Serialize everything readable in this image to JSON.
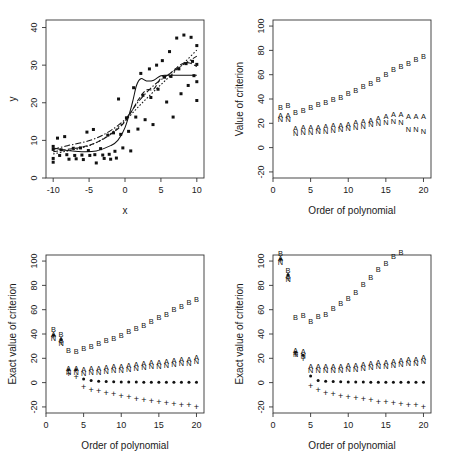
{
  "figure": {
    "panel_count": 4,
    "background": "#ffffff",
    "marker_color": "#111111"
  },
  "chart_data": [
    {
      "id": "panel-top-left",
      "type": "scatter",
      "title": "",
      "xlabel": "x",
      "ylabel": "y",
      "xlim": [
        -11,
        11
      ],
      "ylim": [
        0,
        42
      ],
      "xticks": [
        -10,
        -5,
        0,
        5,
        10
      ],
      "yticks": [
        0,
        10,
        20,
        30,
        40
      ],
      "xtick_labels": [
        "-10",
        "-5",
        "0",
        "5",
        "10"
      ],
      "ytick_labels": [
        "0",
        "10",
        "20",
        "30",
        "40"
      ],
      "grid": false,
      "legend": "none",
      "points": [
        [
          -10,
          8.4
        ],
        [
          -10,
          7.6
        ],
        [
          -10,
          5.2
        ],
        [
          -10,
          4.2
        ],
        [
          -9.4,
          10.6
        ],
        [
          -9.1,
          6.0
        ],
        [
          -8.9,
          7.5
        ],
        [
          -8.4,
          11.0
        ],
        [
          -8.1,
          6.2
        ],
        [
          -7.8,
          5.0
        ],
        [
          -7.2,
          7.9
        ],
        [
          -7.0,
          6.0
        ],
        [
          -6.8,
          5.1
        ],
        [
          -6.2,
          8.0
        ],
        [
          -6.0,
          6.1
        ],
        [
          -5.8,
          4.9
        ],
        [
          -5.3,
          12.2
        ],
        [
          -5.1,
          7.3
        ],
        [
          -4.9,
          6.0
        ],
        [
          -4.4,
          12.9
        ],
        [
          -4.2,
          6.2
        ],
        [
          -4.0,
          4.0
        ],
        [
          -3.4,
          7.8
        ],
        [
          -3.1,
          6.1
        ],
        [
          -2.9,
          5.2
        ],
        [
          -2.4,
          11.4
        ],
        [
          -2.2,
          6.3
        ],
        [
          -2.0,
          5.0
        ],
        [
          -1.6,
          12.0
        ],
        [
          -1.4,
          7.1
        ],
        [
          -1.2,
          5.3
        ],
        [
          -0.9,
          21.0
        ],
        [
          -0.6,
          11.6
        ],
        [
          -0.3,
          8.0
        ],
        [
          0.2,
          16.0
        ],
        [
          0.5,
          12.4
        ],
        [
          0.8,
          7.2
        ],
        [
          1.2,
          24.0
        ],
        [
          1.5,
          16.2
        ],
        [
          1.8,
          13.0
        ],
        [
          2.2,
          27.8
        ],
        [
          2.5,
          22.0
        ],
        [
          2.8,
          15.5
        ],
        [
          3.4,
          29.0
        ],
        [
          3.6,
          21.4
        ],
        [
          3.9,
          14.2
        ],
        [
          4.4,
          30.0
        ],
        [
          4.6,
          23.6
        ],
        [
          5.2,
          31.2
        ],
        [
          5.5,
          26.8
        ],
        [
          5.8,
          20.2
        ],
        [
          6.2,
          33.6
        ],
        [
          6.4,
          27.0
        ],
        [
          6.7,
          16.2
        ],
        [
          7.2,
          37.2
        ],
        [
          7.5,
          29.0
        ],
        [
          7.8,
          22.4
        ],
        [
          8.2,
          38.0
        ],
        [
          8.5,
          30.4
        ],
        [
          8.8,
          24.6
        ],
        [
          9.2,
          37.4
        ],
        [
          9.4,
          31.0
        ],
        [
          9.6,
          27.2
        ],
        [
          10,
          35.2
        ],
        [
          10,
          30.2
        ],
        [
          10,
          25.6
        ],
        [
          10,
          20.6
        ]
      ],
      "curves": [
        {
          "name": "fit-solid",
          "style": "solid",
          "x": [
            -10,
            -8,
            -6,
            -4,
            -2,
            -1,
            0,
            1,
            1.6,
            2.2,
            3,
            4,
            5,
            6,
            7,
            8,
            9,
            10
          ],
          "y": [
            8.0,
            7.3,
            7.0,
            7.2,
            8.6,
            10.0,
            13.4,
            19.8,
            24.6,
            26.4,
            25.8,
            26.0,
            27.2,
            27.3,
            27.3,
            27.3,
            27.3,
            27.3
          ]
        },
        {
          "name": "fit-dashed",
          "style": "dashed",
          "x": [
            -10,
            -8,
            -6,
            -4,
            -2,
            0,
            2,
            3,
            4,
            5,
            6,
            7,
            8,
            9,
            10
          ],
          "y": [
            7.0,
            7.6,
            8.2,
            9.4,
            11.6,
            15.0,
            21.2,
            23.4,
            23.6,
            26.6,
            27.4,
            29.0,
            30.4,
            30.6,
            29.6
          ]
        },
        {
          "name": "fit-dotted",
          "style": "dotted",
          "x": [
            -10,
            -8,
            -6,
            -4,
            -2,
            0,
            2,
            4,
            6,
            8,
            10
          ],
          "y": [
            6.4,
            7.2,
            8.0,
            9.4,
            11.8,
            15.2,
            19.2,
            23.0,
            26.6,
            30.2,
            34.0
          ]
        },
        {
          "name": "fit-dashdot",
          "style": "dashdot",
          "x": [
            -10,
            -8,
            -6,
            -4,
            -2,
            0,
            2,
            4,
            6,
            8,
            10
          ],
          "y": [
            7.6,
            8.6,
            9.4,
            10.6,
            12.6,
            15.6,
            20.6,
            24.6,
            27.4,
            30.0,
            32.4
          ]
        }
      ]
    },
    {
      "id": "panel-top-right",
      "type": "scatter",
      "title": "",
      "xlabel": "Order of polynomial",
      "ylabel": "Value of criterion",
      "xlim": [
        0,
        21
      ],
      "ylim": [
        -25,
        105
      ],
      "xticks": [
        0,
        5,
        10,
        15,
        20
      ],
      "yticks": [
        -20,
        0,
        20,
        40,
        60,
        80,
        100
      ],
      "xtick_labels": [
        "0",
        "5",
        "10",
        "15",
        "20"
      ],
      "ytick_labels": [
        "-20",
        "0",
        "20",
        "40",
        "60",
        "80",
        "100"
      ],
      "grid": false,
      "legend": "none",
      "x": [
        1,
        2,
        3,
        4,
        5,
        6,
        7,
        8,
        9,
        10,
        11,
        12,
        13,
        14,
        15,
        16,
        17,
        18,
        19,
        20
      ],
      "series": [
        {
          "name": "B",
          "marker": "B",
          "values": [
            30.5,
            31.5,
            26.0,
            28.0,
            30.5,
            32.5,
            34.5,
            37.0,
            38.5,
            41.5,
            44.5,
            47.5,
            50.0,
            53.5,
            57.5,
            61.5,
            63.5,
            66.5,
            69.5,
            72.0
          ]
        },
        {
          "name": "A",
          "marker": "A",
          "values": [
            26.5,
            26.5,
            15.5,
            16.5,
            16.5,
            17.0,
            17.5,
            18.0,
            18.5,
            19.5,
            20.5,
            21.5,
            22.5,
            24.0,
            25.5,
            27.0,
            27.5,
            26.0,
            25.5,
            25.5
          ]
        },
        {
          "name": "N",
          "marker": "N",
          "values": [
            26.0,
            26.0,
            14.5,
            15.0,
            15.5,
            16.0,
            16.5,
            17.0,
            17.5,
            18.5,
            19.5,
            20.5,
            21.5,
            22.5,
            23.5,
            24.5,
            23.5,
            17.5,
            17.5,
            16.5
          ]
        }
      ]
    },
    {
      "id": "panel-bottom-left",
      "type": "scatter",
      "title": "",
      "xlabel": "Order of polynomial",
      "ylabel": "Exact value of criterion",
      "xlim": [
        0,
        21
      ],
      "ylim": [
        -25,
        105
      ],
      "xticks": [
        0,
        5,
        10,
        15,
        20
      ],
      "yticks": [
        -20,
        0,
        20,
        40,
        60,
        80,
        100
      ],
      "xtick_labels": [
        "0",
        "5",
        "10",
        "15",
        "20"
      ],
      "ytick_labels": [
        "-20",
        "0",
        "20",
        "40",
        "60",
        "80",
        "100"
      ],
      "grid": false,
      "legend": "none",
      "x": [
        1,
        2,
        3,
        4,
        5,
        6,
        7,
        8,
        9,
        10,
        11,
        12,
        13,
        14,
        15,
        16,
        17,
        18,
        19,
        20
      ],
      "series": [
        {
          "name": "B",
          "marker": "B",
          "values": [
            41.0,
            36.5,
            23.5,
            23.0,
            25.0,
            27.0,
            29.5,
            31.5,
            33.5,
            36.0,
            39.0,
            41.5,
            44.5,
            47.5,
            50.5,
            53.5,
            57.0,
            60.0,
            63.0,
            65.5
          ]
        },
        {
          "name": "A",
          "marker": "A",
          "values": [
            39.5,
            35.5,
            11.5,
            11.5,
            11.0,
            11.5,
            12.0,
            12.5,
            13.0,
            13.5,
            14.5,
            15.0,
            15.5,
            16.5,
            17.0,
            17.5,
            18.5,
            19.0,
            19.5,
            20.5
          ]
        },
        {
          "name": "N",
          "marker": "N",
          "values": [
            39.0,
            35.0,
            11.0,
            11.0,
            10.5,
            11.0,
            11.5,
            12.0,
            12.5,
            13.0,
            14.0,
            14.5,
            15.0,
            16.0,
            16.5,
            17.0,
            18.0,
            18.5,
            19.0,
            20.0
          ]
        },
        {
          "name": "star",
          "marker": "*",
          "values": [
            39.0,
            35.5,
            10.5,
            10.5,
            3.0,
            1.8,
            1.2,
            0.9,
            0.7,
            0.6,
            0.5,
            0.5,
            0.4,
            0.4,
            0.4,
            0.3,
            0.3,
            0.3,
            0.3,
            0.3
          ]
        },
        {
          "name": "plus",
          "marker": "+",
          "values": [
            38.5,
            33.0,
            7.5,
            5.0,
            -3.5,
            -5.5,
            -7.0,
            -8.5,
            -9.5,
            -10.5,
            -12.0,
            -13.0,
            -14.0,
            -15.0,
            -16.0,
            -16.5,
            -17.5,
            -18.0,
            -18.5,
            -19.5
          ]
        }
      ]
    },
    {
      "id": "panel-bottom-right",
      "type": "scatter",
      "title": "",
      "xlabel": "Order of polynomial",
      "ylabel": "Exact value of criterion",
      "xlim": [
        0,
        21
      ],
      "ylim": [
        -25,
        105
      ],
      "xticks": [
        0,
        5,
        10,
        15,
        20
      ],
      "yticks": [
        -20,
        0,
        20,
        40,
        60,
        80,
        100
      ],
      "xtick_labels": [
        "0",
        "5",
        "10",
        "15",
        "20"
      ],
      "ytick_labels": [
        "-20",
        "0",
        "20",
        "40",
        "60",
        "80",
        "100"
      ],
      "grid": false,
      "legend": "none",
      "note": "B series exceeds the upper axis limit for orders 15 and above and is clipped",
      "x": [
        1,
        2,
        3,
        4,
        5,
        6,
        7,
        8,
        9,
        10,
        11,
        12,
        13,
        14,
        15,
        16,
        17,
        18,
        19,
        20
      ],
      "series": [
        {
          "name": "B",
          "marker": "B",
          "values": [
            103.0,
            89.5,
            50.5,
            52.5,
            47.0,
            51.5,
            53.0,
            58.0,
            62.5,
            66.5,
            71.0,
            77.5,
            83.5,
            90.5,
            95.0,
            100.5,
            104.0,
            108.0,
            112.0,
            116.0
          ]
        },
        {
          "name": "A",
          "marker": "A",
          "values": [
            102.0,
            88.5,
            26.5,
            25.5,
            13.5,
            13.0,
            13.0,
            13.5,
            13.5,
            14.0,
            14.5,
            15.0,
            15.5,
            16.5,
            17.0,
            17.5,
            18.5,
            19.0,
            19.5,
            20.5
          ]
        },
        {
          "name": "N",
          "marker": "N",
          "values": [
            101.5,
            88.0,
            26.0,
            25.0,
            13.0,
            12.5,
            12.5,
            13.0,
            13.0,
            13.5,
            14.0,
            14.5,
            15.0,
            16.0,
            16.5,
            17.0,
            18.0,
            18.5,
            19.0,
            20.0
          ]
        },
        {
          "name": "star",
          "marker": "*",
          "values": [
            101.5,
            88.5,
            25.0,
            22.5,
            5.5,
            1.8,
            1.2,
            0.9,
            0.7,
            0.6,
            0.5,
            0.5,
            0.4,
            0.4,
            0.4,
            0.3,
            0.3,
            0.3,
            0.3,
            0.3
          ]
        },
        {
          "name": "plus",
          "marker": "+",
          "values": [
            101.0,
            85.5,
            22.5,
            19.5,
            -3.0,
            -6.0,
            -8.0,
            -9.5,
            -10.5,
            -11.5,
            -12.5,
            -13.5,
            -14.5,
            -15.5,
            -16.0,
            -17.0,
            -17.5,
            -18.0,
            -18.5,
            -19.5
          ]
        }
      ]
    }
  ]
}
